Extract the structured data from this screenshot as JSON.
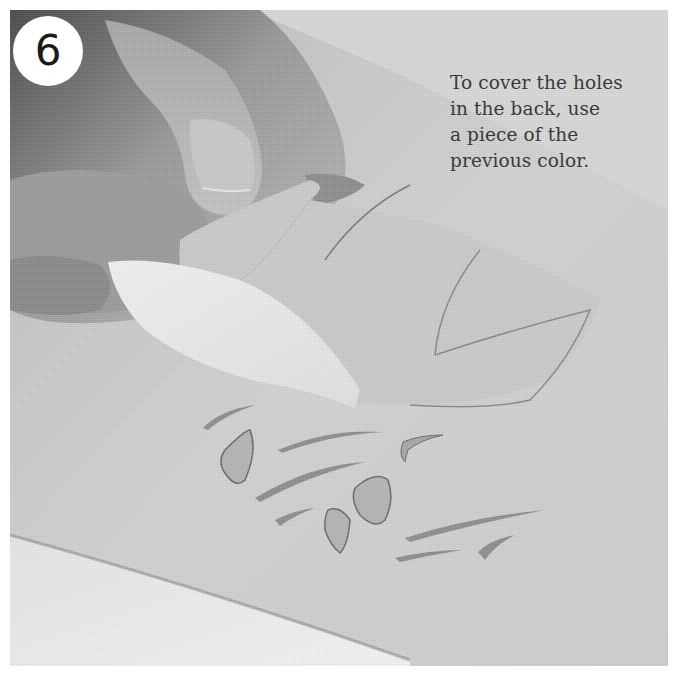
{
  "step": {
    "number": "6"
  },
  "caption": {
    "lines": [
      "To cover the holes",
      "in the back, use",
      "a piece of the",
      "previous color."
    ]
  },
  "photo": {
    "description": "Hand peeling a translucent paper piece over a cut-paper bird design with leaf/branch cutouts",
    "palette": {
      "background_paper": "#d2d2d2",
      "highlight_paper": "#ececec",
      "hand_shadow": "#3c3c3c",
      "cut_lines": "#4a4a4a",
      "border": "#ffffff",
      "badge": "#ffffff",
      "caption_text": "#3a3a3a"
    }
  }
}
